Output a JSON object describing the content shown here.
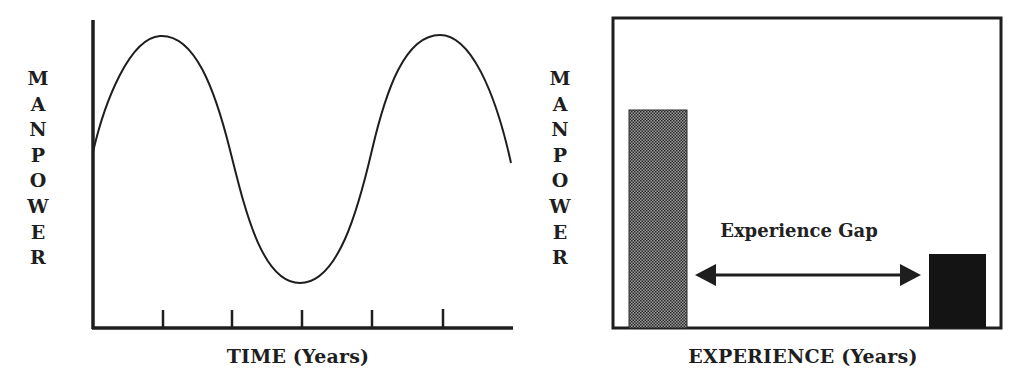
{
  "chart_data": [
    {
      "type": "line",
      "title": "",
      "xlabel": "TIME (Years)",
      "ylabel": "MANPOWER",
      "x_ticks": 5,
      "x_tick_labels": [],
      "y_tick_labels": [],
      "grid": false,
      "legend": null,
      "series": [
        {
          "name": "Manpower over time (cyclical)",
          "shape": "sinusoid",
          "x": [
            0,
            0.5,
            1,
            1.5,
            2,
            2.5,
            3,
            3.5,
            4,
            4.5,
            5,
            5.5,
            6
          ],
          "values": [
            0.62,
            0.9,
            1.0,
            0.8,
            0.42,
            0.1,
            0.0,
            0.12,
            0.5,
            0.88,
            1.0,
            0.88,
            0.56
          ]
        }
      ],
      "xlim": [
        0,
        6
      ],
      "ylim": [
        -0.2,
        1.1
      ]
    },
    {
      "type": "bar",
      "title": "",
      "xlabel": "EXPERIENCE (Years)",
      "ylabel": "MANPOWER",
      "categories": [
        "Low experience",
        "High experience"
      ],
      "values": [
        70,
        24
      ],
      "bar_styles": [
        "stippled-gray",
        "solid-black"
      ],
      "annotations": [
        {
          "text": "Experience Gap",
          "type": "double-arrow",
          "from": "Low experience",
          "to": "High experience"
        }
      ],
      "grid": false,
      "legend": null,
      "ylim": [
        0,
        100
      ]
    }
  ],
  "left": {
    "ylabel": "MANPOWER",
    "xlabel": "TIME (Years)"
  },
  "right": {
    "ylabel": "MANPOWER",
    "xlabel": "EXPERIENCE (Years)",
    "annotation": "Experience Gap"
  },
  "colors": {
    "ink": "#1e1e1e",
    "bar_stipple": "#6a6a6a",
    "bar_solid": "#141414",
    "background": "#ffffff"
  }
}
